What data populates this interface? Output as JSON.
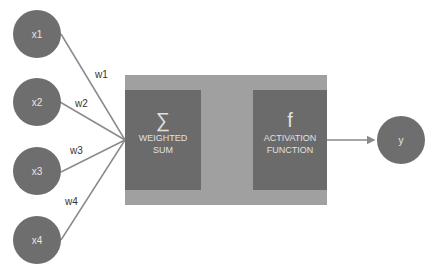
{
  "diagram": {
    "inputs": [
      {
        "label": "x1",
        "weight": "w1"
      },
      {
        "label": "x2",
        "weight": "w2"
      },
      {
        "label": "x3",
        "weight": "w3"
      },
      {
        "label": "x4",
        "weight": "w4"
      }
    ],
    "weighted_sum": {
      "symbol": "∑",
      "line1": "WEIGHTED",
      "line2": "SUM"
    },
    "activation": {
      "symbol": "f",
      "line1": "ACTIVATION",
      "line2": "FUNCTION"
    },
    "output": {
      "label": "y"
    },
    "colors": {
      "node": "#6e6e6e",
      "outer_box": "#a0a0a0",
      "inner_box": "#6b6b6b",
      "line": "#8a8a8a"
    }
  }
}
